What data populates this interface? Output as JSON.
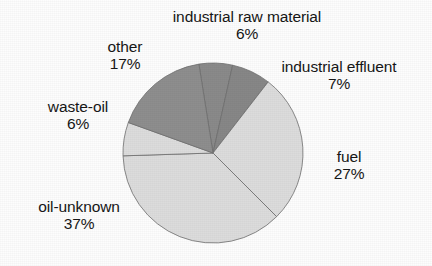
{
  "chart_data": {
    "type": "pie",
    "title": "",
    "subtitle": "",
    "xlabel": "",
    "ylabel": "",
    "legend_position": "none",
    "labels_inline": true,
    "grid": false,
    "units": "percent",
    "total": 100,
    "start_angle_deg": -9,
    "direction": "clockwise",
    "categories": [
      "industrial raw material",
      "industrial effluent",
      "fuel",
      "oil-unknown",
      "waste-oil",
      "other"
    ],
    "values": [
      6,
      7,
      27,
      37,
      6,
      17
    ],
    "slices": [
      {
        "name": "industrial raw material",
        "value": 6,
        "value_text": "6%",
        "color": "#8a8a8a",
        "label_name": "industrial raw material",
        "label_value": "6%"
      },
      {
        "name": "industrial effluent",
        "value": 7,
        "value_text": "7%",
        "color": "#878787",
        "label_name": "industrial effluent",
        "label_value": "7%"
      },
      {
        "name": "fuel",
        "value": 27,
        "value_text": "27%",
        "color": "#dcdcdc",
        "label_name": "fuel",
        "label_value": "27%"
      },
      {
        "name": "oil-unknown",
        "value": 37,
        "value_text": "37%",
        "color": "#dcdcdc",
        "label_name": "oil-unknown",
        "label_value": "37%"
      },
      {
        "name": "waste-oil",
        "value": 6,
        "value_text": "6%",
        "color": "#dcdcdc",
        "label_name": "waste-oil",
        "label_value": "6%"
      },
      {
        "name": "other",
        "value": 17,
        "value_text": "17%",
        "color": "#8e8e8e",
        "label_name": "other",
        "label_value": "17%"
      }
    ],
    "colors": {
      "light_gray": "#dcdcdc",
      "medium_gray": "#8e8e8e",
      "dark_gray": "#878787",
      "outline": "#6f6f6f",
      "background": "#fdfdfd",
      "text": "#161616"
    },
    "geometry": {
      "center_x": 213,
      "center_y": 153,
      "radius": 90
    }
  }
}
